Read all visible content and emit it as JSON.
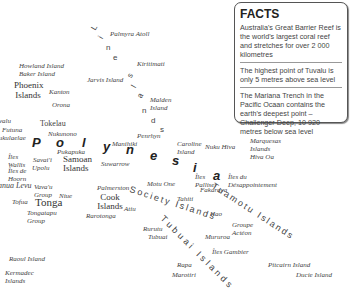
{
  "facts": {
    "title": "FACTS",
    "items": [
      "Australia's Great Barrier Reef is the world's largest coral reef and stretches for over 2 000 kilometres",
      "The highest point of Tuvalu is only 5 metres above sea level",
      "The Mariana Trench in the Pacific Ocaan contains the earth's deepest point – Challenger Deep, 10 920 metres below sea level"
    ]
  },
  "region": {
    "name": "Polynesia",
    "letters": [
      "P",
      "o",
      "l",
      "y",
      "n",
      "e",
      "s",
      "i",
      "a"
    ]
  },
  "line_islands": {
    "letters": [
      "L",
      "i",
      "n",
      "e",
      "I",
      "s",
      "l",
      "a",
      "n",
      "d",
      "s"
    ]
  },
  "places": {
    "palmyra": "Palmyra Atoll",
    "kiritimati": "Kiritimati",
    "howland": "Howland Island",
    "baker": "Baker Island",
    "phoenix": "Phoenix Islands",
    "kanton": "Kanton",
    "jarvis": "Jarvis Island",
    "malden": "Malden Island",
    "orona": "Orona",
    "tuvalu": "Tuvalu",
    "futuna": "Futuna",
    "nukulaelae": "Nukulaelae",
    "tokelau": "Tokelau",
    "nukunono": "Nukunono",
    "manihiki": "Manihiki",
    "penrhyn": "Penrhyn",
    "caroline": "Caroline Island",
    "nukuhiva": "Nuku Hiva",
    "marquesas": "Marquesas Islands",
    "hivaoa": "Hiva Oa",
    "wallis": "Îles Wallis",
    "pukapuka": "Pukapuka",
    "savaii": "Savai'i",
    "upolu": "Upolu",
    "samoan": "Samoan Islands",
    "suwarrow": "Suwarrow",
    "hoorn": "Îles de Hoorn",
    "vanualevu": "Vanua Levu",
    "vavau": "Vava'u Group",
    "niue": "Niue",
    "tofua": "Tofua",
    "tonga": "Tonga",
    "tongatapu": "Tongatapu Group",
    "palmerston": "Palmerston",
    "cook": "Cook Islands",
    "rarotonga": "Rarotonga",
    "atiu": "Atiu",
    "motuone": "Motu One",
    "palliser": "Îles Palliser",
    "desappointement": "Îles du Désappointement",
    "fakarava": "Fakarava",
    "tahiti": "Tahiti",
    "society": "Society Islands",
    "tuamotu": "Tuamotu Islands",
    "hao": "Hao",
    "rurutu": "Rurutu",
    "tubuai": "Tubuai",
    "tubuai_islands": "Tubuai Islands",
    "mururoa": "Mururoa",
    "acteon": "Groupe Actéon",
    "gambier": "Îles Gambier",
    "rapa": "Rapa",
    "marotiri": "Marotiri",
    "pitcairn": "Pitcairn Island",
    "ducie": "Ducie Island",
    "raoul": "Raoul Island",
    "kermadec": "Kermadec Islands"
  }
}
